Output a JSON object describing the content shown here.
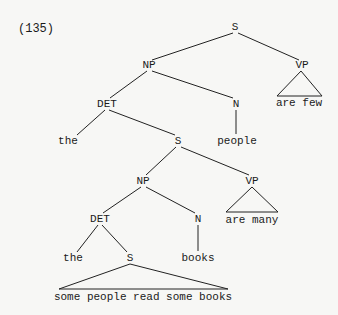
{
  "example_number": "(135)",
  "nodes": {
    "s_root": "S",
    "np_1": "NP",
    "vp_1": "VP",
    "vp_1_text": "are few",
    "det_1": "DET",
    "n_1": "N",
    "the_1": "the",
    "s_2": "S",
    "people": "people",
    "np_2": "NP",
    "vp_2": "VP",
    "vp_2_text": "are many",
    "det_2": "DET",
    "n_2": "N",
    "the_2": "the",
    "s_3": "S",
    "books": "books",
    "s_3_text": "some people read some books"
  }
}
